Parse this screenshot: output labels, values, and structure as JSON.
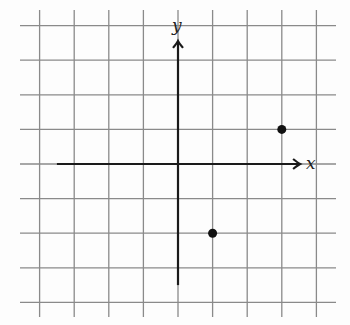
{
  "diagram": {
    "type": "coordinate-grid",
    "x_axis_label": "x",
    "y_axis_label": "y",
    "grid": {
      "x_range": [
        -4,
        4
      ],
      "y_range": [
        -4,
        4
      ],
      "step": 1
    },
    "axis_extent": {
      "x": [
        -3.5,
        3.5
      ],
      "y": [
        -3.5,
        3.5
      ]
    },
    "points": [
      {
        "x": 3,
        "y": 1
      },
      {
        "x": 1,
        "y": -2
      }
    ],
    "colors": {
      "grid": "#8a8a8a",
      "axis": "#1a1a1a",
      "point": "#111111"
    }
  }
}
